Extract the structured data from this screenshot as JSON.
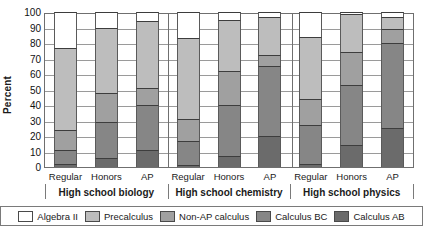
{
  "chart_data": {
    "type": "bar",
    "subtype": "stacked-bar-grouped",
    "title": "",
    "xlabel": "",
    "ylabel": "Percent",
    "ylim": [
      0,
      100
    ],
    "yticks": [
      100,
      90,
      80,
      70,
      60,
      50,
      40,
      30,
      20,
      10,
      0
    ],
    "grid": true,
    "legend_position": "bottom",
    "groups": [
      "High school biology",
      "High school chemistry",
      "High school physics"
    ],
    "categories": [
      "Regular",
      "Honors",
      "AP",
      "Regular",
      "Honors",
      "AP",
      "Regular",
      "Honors",
      "AP"
    ],
    "series": [
      {
        "name": "Calculus AB",
        "color": "#6b6b6b",
        "values": [
          2,
          6,
          11,
          1,
          7,
          20,
          2,
          14,
          25
        ]
      },
      {
        "name": "Calculus BC",
        "color": "#868686",
        "values": [
          9,
          23,
          29,
          16,
          33,
          45,
          25,
          39,
          55
        ]
      },
      {
        "name": "Non-AP calculus",
        "color": "#a0a0a0",
        "values": [
          13,
          19,
          11,
          14,
          22,
          7,
          17,
          21,
          9
        ]
      },
      {
        "name": "Precalculus",
        "color": "#bdbdbd",
        "values": [
          53,
          42,
          43,
          52,
          33,
          25,
          40,
          25,
          8
        ]
      },
      {
        "name": "Algebra II",
        "color": "#ffffff",
        "values": [
          23,
          10,
          6,
          17,
          5,
          3,
          16,
          1,
          3
        ]
      }
    ],
    "cumulative_tops": {
      "Calculus AB": [
        2,
        6,
        11,
        1,
        7,
        20,
        2,
        14,
        25
      ],
      "Calculus BC": [
        11,
        29,
        40,
        17,
        40,
        65,
        27,
        53,
        80
      ],
      "Non-AP calculus": [
        24,
        48,
        51,
        31,
        62,
        72,
        44,
        74,
        89
      ],
      "Precalculus": [
        77,
        90,
        94,
        83,
        95,
        97,
        84,
        99,
        97
      ],
      "Algebra II": [
        100,
        100,
        100,
        100,
        100,
        100,
        100,
        100,
        100
      ]
    }
  },
  "axis": {
    "y_title": "Percent",
    "y_labels": [
      "100",
      "90",
      "80",
      "70",
      "60",
      "50",
      "40",
      "30",
      "20",
      "10",
      "0"
    ]
  },
  "groups": [
    {
      "label": "High school biology",
      "categories": [
        "Regular",
        "Honors",
        "AP"
      ]
    },
    {
      "label": "High school chemistry",
      "categories": [
        "Regular",
        "Honors",
        "AP"
      ]
    },
    {
      "label": "High school physics",
      "categories": [
        "Regular",
        "Honors",
        "AP"
      ]
    }
  ],
  "legend": [
    {
      "label": "Algebra II",
      "color": "#ffffff"
    },
    {
      "label": "Precalculus",
      "color": "#bdbdbd"
    },
    {
      "label": "Non-AP calculus",
      "color": "#a0a0a0"
    },
    {
      "label": "Calculus BC",
      "color": "#868686"
    },
    {
      "label": "Calculus AB",
      "color": "#6b6b6b"
    }
  ]
}
